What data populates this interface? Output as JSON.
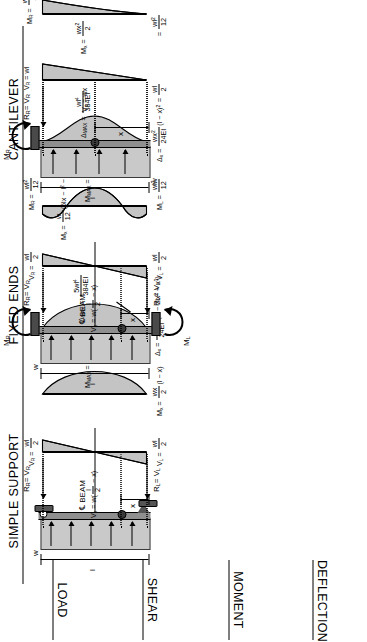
{
  "sheet": {
    "row_labels": [
      "LOAD",
      "SHEAR",
      "MOMENT",
      "DEFLECTION"
    ],
    "columns": [
      {
        "id": "simple-support",
        "title": "SIMPLE SUPPORT",
        "load": {
          "udl_symbol": "w",
          "span_symbol": "l",
          "distance_symbol": "x",
          "centerline_label": "BEAM",
          "centerline_glyph": "℄",
          "left_reaction": "R",
          "left_reaction_sub": "L",
          "left_reaction_eq": "= V",
          "left_reaction_eq_sub": "L",
          "right_reaction": "R",
          "right_reaction_sub": "R",
          "right_reaction_eq": "= V",
          "right_reaction_eq_sub": "R"
        },
        "shear": {
          "left": "V_L = wl/2",
          "right": "V_R = wl/2",
          "general": "V_x = w(l/2 − x)"
        },
        "moment": {
          "max": "M_MAX = wl²/8",
          "general": "M_x = wx/2 (l − x)"
        },
        "deflection": {
          "max": "Δ_MAX = 5wl⁴/384EI",
          "general": "Δ_x = wx/24EI (l³ − 2lx² + x³)"
        }
      },
      {
        "id": "fixed-ends",
        "title": "FIXED ENDS",
        "load": {
          "udl_symbol": "w",
          "span_symbol": "l",
          "distance_symbol": "x",
          "centerline_label": "BEAM",
          "centerline_glyph": "℄",
          "left_moment": "M",
          "left_moment_sub": "L",
          "right_moment": "M",
          "right_moment_sub": "R",
          "left_reaction": "R",
          "left_reaction_sub": "L",
          "left_reaction_eq": "= V",
          "left_reaction_eq_sub": "L",
          "right_reaction": "R",
          "right_reaction_sub": "R",
          "right_reaction_eq": "= V",
          "right_reaction_eq_sub": "R"
        },
        "shear": {
          "left": "V_L = wl/2",
          "right": "V_R = wl/2",
          "general": "V_x = w(l/2 − x)"
        },
        "moment": {
          "left": "M_L = wl²/12",
          "right": "M_R = wl²/12",
          "max": "M_MAX = wl²/24",
          "general": "M_x = w/12 (6lx − l² − 6x²)"
        },
        "deflection": {
          "max": "Δ_MAX = wl⁴/384EI",
          "general": "Δ_x = wx²/24EI (l − x)²"
        }
      },
      {
        "id": "cantilever",
        "title": "CANTILEVER",
        "load": {
          "udl_symbol": "w",
          "span_symbol": "l",
          "distance_symbol": "x",
          "right_moment": "M",
          "right_moment_sub": "R",
          "right_reaction": "R",
          "right_reaction_sub": "R",
          "right_reaction_eq": "= V",
          "right_reaction_eq_sub": "R"
        },
        "shear": {
          "right": "V_R = wl",
          "general": "V_x = wx",
          "stub": "wl/2"
        },
        "moment": {
          "right": "M_R = wl²/2",
          "general": "M_x = wx²/2",
          "stub": "wl²/12"
        },
        "deflection": {
          "max": "Δ_MAX = wl⁴/8EI",
          "general": "Δ_x = w/24EI (x⁴ − 4l³x + 3l⁴)"
        }
      }
    ]
  },
  "glyphs": {
    "w": "w",
    "l": "l",
    "x": "x",
    "equals": "=",
    "delta": "Δ",
    "V": "V",
    "M": "M",
    "R": "R",
    "EI": "EI",
    "two": "2",
    "eight": "8",
    "twelve": "12",
    "twentyfour": "24",
    "twentyfourEI": "24EI",
    "eightEI": "8EI",
    "384EI": "384EI",
    "wl": "wl",
    "wx": "wx",
    "fivewl4": "5wl",
    "sub_L": "L",
    "sub_R": "R",
    "sub_x": "x",
    "sub_MAX": "MAX"
  },
  "colors": {
    "shade": "#c4c4c4",
    "beam": "#8f8f8f",
    "load_block": "#c9c9c9",
    "support": "#4a4a4a",
    "ink": "#000000"
  }
}
